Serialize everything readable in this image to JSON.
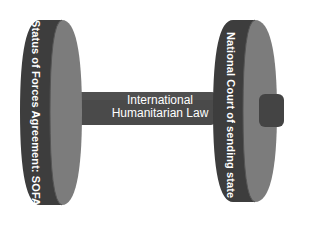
{
  "diagram": {
    "type": "dumbbell",
    "left_weight": {
      "label": "Status of Forces Agreement: SOFA"
    },
    "right_weight": {
      "label": "National Court of sending state"
    },
    "connecting_bar": {
      "label_line1": "International",
      "label_line2": "Humanitarian Law"
    },
    "colors": {
      "disc_front": "#3d3d3d",
      "disc_side": "#7c7c7c",
      "bar": "#4a4a4a",
      "bar_highlight": "#5a5a5a",
      "hub": "#444444",
      "text": "#ffffff",
      "background": "#ffffff"
    }
  }
}
